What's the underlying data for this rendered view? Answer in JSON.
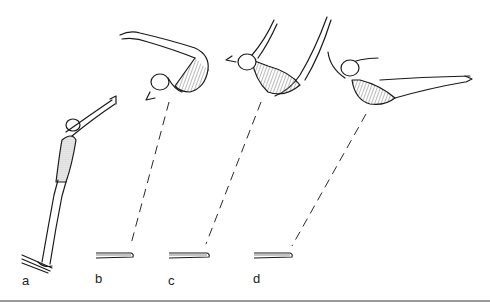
{
  "figure": {
    "stages": [
      {
        "id": "a",
        "label": "a",
        "pose": "standing take-off, arms raised overhead"
      },
      {
        "id": "b",
        "label": "b",
        "pose": "pike position, head down, legs extended"
      },
      {
        "id": "c",
        "label": "c",
        "pose": "open pike, arms and legs raised in V"
      },
      {
        "id": "d",
        "label": "d",
        "pose": "layout, body extending horizontally"
      }
    ],
    "colors": {
      "ink": "#1a1a1a",
      "suit_shade": "#9a9a9a",
      "rule": "#9a9a9a",
      "background": "#ffffff"
    }
  }
}
